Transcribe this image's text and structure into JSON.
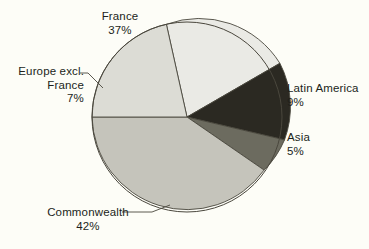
{
  "figure": {
    "background_color": "#fdfdf7",
    "text_color": "#211f1a",
    "outline_color": "#4a473d"
  },
  "chart_data": {
    "type": "pie",
    "title": "",
    "subtitle": "",
    "xlabel": "",
    "ylabel": "",
    "grid": false,
    "legend_position": "none",
    "labels_position": "outside-callout",
    "center": {
      "x": 187,
      "y": 117
    },
    "radius": 95,
    "start_angle_deg": -77,
    "direction": "clockwise",
    "units": "percent",
    "categories": [
      "France",
      "Latin America",
      "Asia",
      "Commonwealth",
      "Europe excl. France"
    ],
    "values": [
      37,
      9,
      5,
      42,
      7
    ],
    "colors": [
      "#eaeae5",
      "#2b2922",
      "#6c6b5f",
      "#c5c4bb",
      "#dcdcd5"
    ],
    "slices": [
      {
        "name": "France",
        "label": "France",
        "value": 37,
        "value_label": "37%",
        "color": "#eaeae5",
        "start_angle_deg": -77,
        "end_angle_deg": 56.2,
        "path": "M 187 117 L 166.4 24.3 A 95 95 0 0 1 279.9 63.3 Z"
      },
      {
        "name": "Latin America",
        "label": "Latin America",
        "value": 9,
        "value_label": "9%",
        "color": "#2b2922",
        "start_angle_deg": 56.2,
        "end_angle_deg": 88.6,
        "path": "M 187 117 L 279.9 63.3 A 95 95 0 0 1 284.5 139.9 Z"
      },
      {
        "name": "Asia",
        "label": "Asia",
        "value": 5,
        "value_label": "5%",
        "color": "#6c6b5f",
        "start_angle_deg": 88.6,
        "end_angle_deg": 106.6,
        "path": "M 187 117 L 284.5 139.9 A 95 95 0 0 1 264.1 170.1 Z"
      },
      {
        "name": "Commonwealth",
        "label": "Commonwealth",
        "value": 42,
        "value_label": "42%",
        "color": "#c5c4bb",
        "start_angle_deg": 106.6,
        "end_angle_deg": 258.0,
        "path": "M 187 117 L 264.1 170.1 A 95 95 0 0 1 92.0 117.0 Z"
      },
      {
        "name": "Europe excl. France",
        "label": "Europe excl. France",
        "label_line1": "Europe excl.",
        "label_line2": "France",
        "value": 7,
        "value_label": "7%",
        "color": "#dcdcd5",
        "start_angle_deg": 258.0,
        "end_angle_deg": 283.0,
        "path": "M 187 117 L 92.0 117.0 A 95 95 0 0 1 166.4 24.3 Z"
      }
    ]
  },
  "labels": {
    "france": {
      "name": "France",
      "percent": "37%"
    },
    "europe": {
      "line1": "Europe excl.",
      "line2": "France",
      "percent": "7%"
    },
    "latin_america": {
      "name": "Latin America",
      "percent": "9%"
    },
    "asia": {
      "name": "Asia",
      "percent": "5%"
    },
    "commonwealth": {
      "name": "Commonwealth",
      "percent": "42%"
    }
  }
}
